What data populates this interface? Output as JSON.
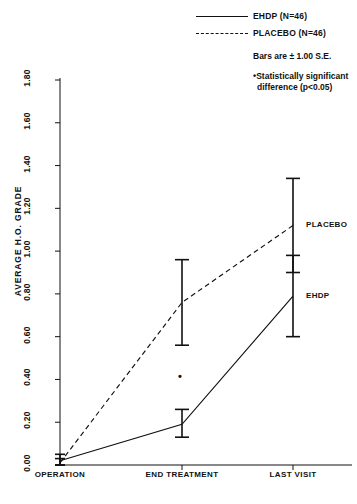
{
  "chart_data": {
    "type": "line",
    "title": "",
    "xlabel": "",
    "ylabel": "AVERAGE H.O. GRADE",
    "categories": [
      "OPERATION",
      "END TREATMENT",
      "LAST VISIT"
    ],
    "ylim": [
      0.0,
      1.8
    ],
    "ytick_step": 0.2,
    "yticks": [
      "0.00",
      "0.20",
      "0.40",
      "0.60",
      "0.80",
      "1.00",
      "1.20",
      "1.40",
      "1.60",
      "1.80"
    ],
    "grid": false,
    "legend_position": "top-right",
    "error_bars": "±1.00 S.E.",
    "series": [
      {
        "name": "EHDP",
        "style": "solid",
        "n": 46,
        "values": [
          0.02,
          0.19,
          0.79
        ],
        "err_low": [
          0.0,
          0.13,
          0.6
        ],
        "err_high": [
          0.05,
          0.26,
          0.98
        ]
      },
      {
        "name": "PLACEBO",
        "style": "dashed",
        "n": 46,
        "values": [
          0.01,
          0.76,
          1.12
        ],
        "err_low": [
          0.0,
          0.56,
          0.9
        ],
        "err_high": [
          0.03,
          0.96,
          1.34
        ]
      }
    ],
    "annotations": [
      {
        "name": "significance-asterisk",
        "symbol": "•",
        "x_category": "END TREATMENT",
        "y": 0.41,
        "meaning": "Statistically significant difference (p<0.05)"
      }
    ],
    "inline_series_labels": [
      {
        "text": "PLACEBO",
        "x_category": "LAST VISIT",
        "y": 1.12
      },
      {
        "text": "EHDP",
        "x_category": "LAST VISIT",
        "y": 0.79
      }
    ]
  },
  "legend": {
    "entries": [
      {
        "label": "EHDP   (N=46)",
        "style": "solid"
      },
      {
        "label": "PLACEBO  (N=46)",
        "style": "dashed"
      }
    ],
    "bars_note": "Bars are ± 1.00 S.E.",
    "significance_note_line1": "Statistically significant",
    "significance_note_line2": "difference (p<0.05)",
    "significance_marker": "•"
  },
  "colors": {
    "ink": "#111111",
    "background": "#ffffff"
  }
}
